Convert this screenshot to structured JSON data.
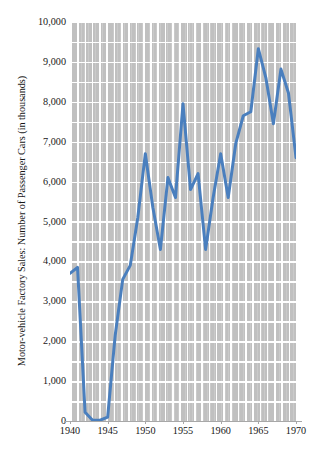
{
  "chart_data": {
    "type": "line",
    "title": "",
    "subtitle": "",
    "xlabel": "",
    "ylabel": "Motor-vehicle Factory Sales: Number of Passenger Cars (in thousands)",
    "legend": [],
    "legend_position": "none",
    "grid": true,
    "xlim": [
      1940,
      1970
    ],
    "ylim": [
      0,
      10000
    ],
    "x_ticks": [
      1940,
      1945,
      1950,
      1955,
      1960,
      1965,
      1970
    ],
    "x_tick_labels": [
      "1940",
      "1945",
      "1950",
      "1955",
      "1960",
      "1965",
      "1970"
    ],
    "y_ticks": [
      0,
      1000,
      2000,
      3000,
      4000,
      5000,
      6000,
      7000,
      8000,
      9000,
      10000
    ],
    "y_tick_labels": [
      "0",
      "1,000",
      "2,000",
      "3,000",
      "4,000",
      "5,000",
      "6,000",
      "7,000",
      "8,000",
      "9,000",
      "10,000"
    ],
    "y_minor_gridline_step": 500,
    "x_minor_gridline_step": 1,
    "series": [
      {
        "name": "Passenger car factory sales",
        "color": "#4a7fbe",
        "line_width": 3,
        "x": [
          1940,
          1941,
          1942,
          1943,
          1944,
          1945,
          1946,
          1947,
          1948,
          1949,
          1950,
          1951,
          1952,
          1953,
          1954,
          1955,
          1956,
          1957,
          1958,
          1959,
          1960,
          1961,
          1962,
          1963,
          1964,
          1965,
          1966,
          1967,
          1968,
          1969,
          1970
        ],
        "values": [
          3700,
          3850,
          220,
          20,
          20,
          100,
          2150,
          3550,
          3900,
          5100,
          6700,
          5350,
          4300,
          6100,
          5600,
          7950,
          5800,
          6200,
          4300,
          5600,
          6700,
          5600,
          6950,
          7650,
          7750,
          9330,
          8600,
          7450,
          8820,
          8220,
          6600
        ]
      }
    ],
    "colors": {
      "line": "#4a7fbe",
      "plot_background": "#c0c0c0",
      "gridline": "#ffffff",
      "axis": "#a8a8a8",
      "text": "#171717",
      "page_background": "#ffffff"
    }
  }
}
